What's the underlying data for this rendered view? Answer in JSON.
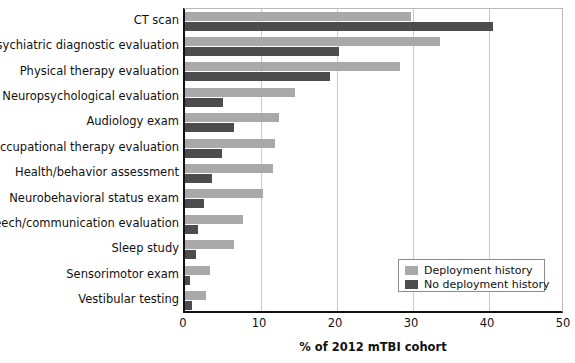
{
  "chart_data": {
    "type": "bar",
    "orientation": "horizontal",
    "title": "",
    "xlabel": "% of 2012 mTBI cohort",
    "ylabel": "",
    "xlim": [
      0,
      50
    ],
    "xticks": [
      0,
      10,
      20,
      30,
      40,
      50
    ],
    "grid": "vertical",
    "legend_position": "bottom-right",
    "categories": [
      "CT scan",
      "Psychiatric diagnostic evaluation",
      "Physical therapy evaluation",
      "Neuropsychological evaluation",
      "Audiology exam",
      "Occupational therapy evaluation",
      "Health/behavior assessment",
      "Neurobehavioral status exam",
      "Speech/communication evaluation",
      "Sleep study",
      "Sensorimotor exam",
      "Vestibular testing"
    ],
    "series": [
      {
        "name": "Deployment history",
        "color": "#a9a9a9",
        "values": [
          29.7,
          33.6,
          28.3,
          14.5,
          12.4,
          11.8,
          11.6,
          10.3,
          7.6,
          6.4,
          3.3,
          2.7
        ]
      },
      {
        "name": "No deployment history",
        "color": "#4c4c4c",
        "values": [
          40.5,
          20.2,
          19.1,
          5.0,
          6.5,
          4.9,
          3.6,
          2.5,
          1.7,
          1.4,
          0.6,
          0.9
        ]
      }
    ]
  },
  "legend": {
    "entries": [
      {
        "label": "Deployment history",
        "color": "#a9a9a9"
      },
      {
        "label": "No deployment history",
        "color": "#4c4c4c"
      }
    ]
  }
}
